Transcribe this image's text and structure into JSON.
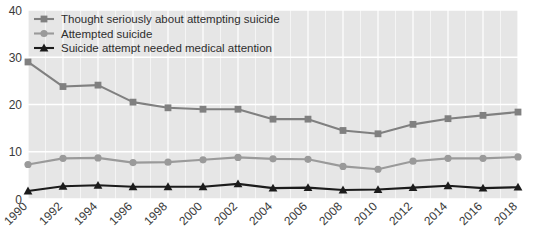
{
  "chart_data": {
    "type": "line",
    "title": "",
    "subtitle": "",
    "xlabel": "",
    "ylabel": "",
    "x": [
      1990,
      1992,
      1994,
      1996,
      1998,
      2000,
      2002,
      2004,
      2006,
      2008,
      2010,
      2012,
      2014,
      2016,
      2018
    ],
    "categories": [
      "1990",
      "1992",
      "1994",
      "1996",
      "1998",
      "2000",
      "2002",
      "2004",
      "2006",
      "2008",
      "2010",
      "2012",
      "2014",
      "2016",
      "2018"
    ],
    "xlim": [
      1990,
      2018
    ],
    "ylim": [
      0,
      40
    ],
    "yticks": [
      0,
      10,
      20,
      30,
      40
    ],
    "ytick_labels": [
      "0",
      "10",
      "20",
      "30",
      "40"
    ],
    "grid": true,
    "grid_color": "#ffffff",
    "plot_background": "#e6e6e6",
    "legend_position": "top-left",
    "series": [
      {
        "name": "Thought seriously about attempting suicide",
        "color": "#808080",
        "marker": "square",
        "values": [
          29.0,
          23.8,
          24.1,
          20.5,
          19.3,
          19.0,
          19.0,
          16.9,
          16.9,
          14.5,
          13.8,
          15.8,
          17.0,
          17.7,
          18.4
        ]
      },
      {
        "name": "Attempted suicide",
        "color": "#9a9a9a",
        "marker": "circle",
        "values": [
          7.3,
          8.6,
          8.7,
          7.7,
          7.8,
          8.3,
          8.8,
          8.5,
          8.4,
          6.9,
          6.3,
          8.0,
          8.6,
          8.6,
          8.9
        ]
      },
      {
        "name": "Suicide attempt needed medical attention",
        "color": "#1c1c1c",
        "marker": "triangle",
        "values": [
          1.7,
          2.7,
          2.9,
          2.6,
          2.6,
          2.6,
          3.2,
          2.3,
          2.4,
          1.9,
          2.0,
          2.4,
          2.8,
          2.3,
          2.5
        ]
      }
    ]
  }
}
